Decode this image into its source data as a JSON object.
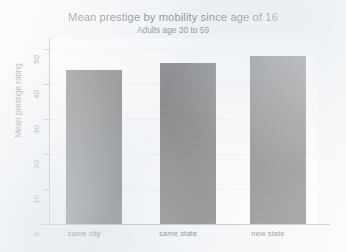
{
  "chart_data": {
    "type": "bar",
    "title": "Mean prestige by mobility since age of 16",
    "subtitle": "Adults age 30 to 59",
    "xlabel": "",
    "ylabel": "Mean prestige rating",
    "categories": [
      "same city",
      "same state",
      "new state"
    ],
    "values": [
      44,
      46,
      48
    ],
    "ylim": [
      0,
      53
    ],
    "yticks": [
      0,
      10,
      20,
      30,
      40,
      50
    ],
    "ytick_labels": [
      "0",
      "10",
      "20",
      "30",
      "40",
      "50"
    ],
    "grid": true,
    "legend": false,
    "bar_color": "#3b3b3b",
    "panel_color": "#fdfdfd",
    "background_color": "#f3f5f7"
  }
}
